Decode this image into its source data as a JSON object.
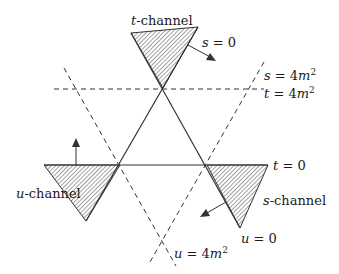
{
  "diagram": {
    "regions": [
      {
        "id": "t",
        "label_var": "t",
        "label_rest": "-channel"
      },
      {
        "id": "u",
        "label_var": "u",
        "label_rest": "-channel"
      },
      {
        "id": "s",
        "label_var": "s",
        "label_rest": "-channel"
      }
    ],
    "lines": {
      "s0": {
        "lhs": "s",
        "rhs": "= 0"
      },
      "t0": {
        "lhs": "t",
        "rhs": "= 0"
      },
      "u0": {
        "lhs": "u",
        "rhs": "= 0"
      },
      "s4": {
        "lhs": "s",
        "rhs": "= 4",
        "var": "m",
        "exp": "2"
      },
      "t4": {
        "lhs": "t",
        "rhs": "= 4",
        "var": "m",
        "exp": "2"
      },
      "u4": {
        "lhs": "u",
        "rhs": "= 4",
        "var": "m",
        "exp": "2"
      }
    },
    "colors": {
      "line": "#333333",
      "hatch": "#444444",
      "background": "#ffffff"
    }
  }
}
